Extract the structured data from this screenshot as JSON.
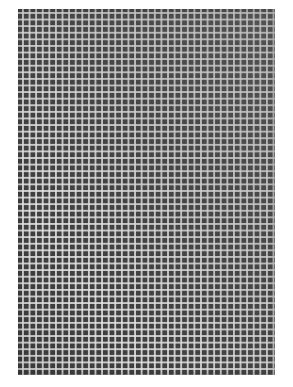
{
  "image": {
    "subject": "Photograph of a square woven mesh grid",
    "colors": {
      "background": "#ffffff",
      "cell_fill": "#3f3f3f",
      "grid_lines": "#e6e6e6"
    },
    "grid": {
      "columns": 39,
      "rows": 55,
      "pitch_px": 6.6
    }
  },
  "captions": {
    "top": "",
    "bottom": ""
  }
}
